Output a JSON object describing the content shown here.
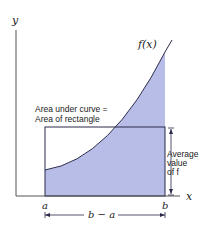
{
  "diagram": {
    "axes": {
      "x_label": "x",
      "y_label": "y"
    },
    "curve_label": "f(x)",
    "annotation_area": {
      "line1": "Area under curve =",
      "line2": "Area of rectangle"
    },
    "annotation_avg": {
      "line1": "Average",
      "line2": "value",
      "line3": "of f"
    },
    "tick_a": "a",
    "tick_b": "b",
    "interval_label": "b − a",
    "colors": {
      "fill": "#b8bde8",
      "line": "#2a2a4a",
      "axis": "#555555",
      "text": "#222222"
    }
  }
}
